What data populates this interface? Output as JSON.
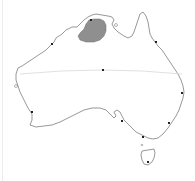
{
  "map": {
    "region": "Australia",
    "outline_color": "#6b6b6b",
    "land_fill": "#ffffff",
    "highlight_fill": "#8f8f8f",
    "tropic_line_color": "#d8d8d8",
    "marker_color": "#222222",
    "markers": [
      {
        "id": "north-coast",
        "x": 91,
        "y": 20
      },
      {
        "id": "northwest-coast",
        "x": 52,
        "y": 44
      },
      {
        "id": "northeast-coast",
        "x": 156,
        "y": 42
      },
      {
        "id": "center",
        "x": 103,
        "y": 70
      },
      {
        "id": "east-coast",
        "x": 182,
        "y": 93
      },
      {
        "id": "southwest-coast",
        "x": 32,
        "y": 112
      },
      {
        "id": "south-coast",
        "x": 122,
        "y": 121
      },
      {
        "id": "southeast-coast",
        "x": 169,
        "y": 123
      },
      {
        "id": "south-east-tip",
        "x": 143,
        "y": 137
      },
      {
        "id": "tasmania",
        "x": 148,
        "y": 162
      }
    ]
  }
}
